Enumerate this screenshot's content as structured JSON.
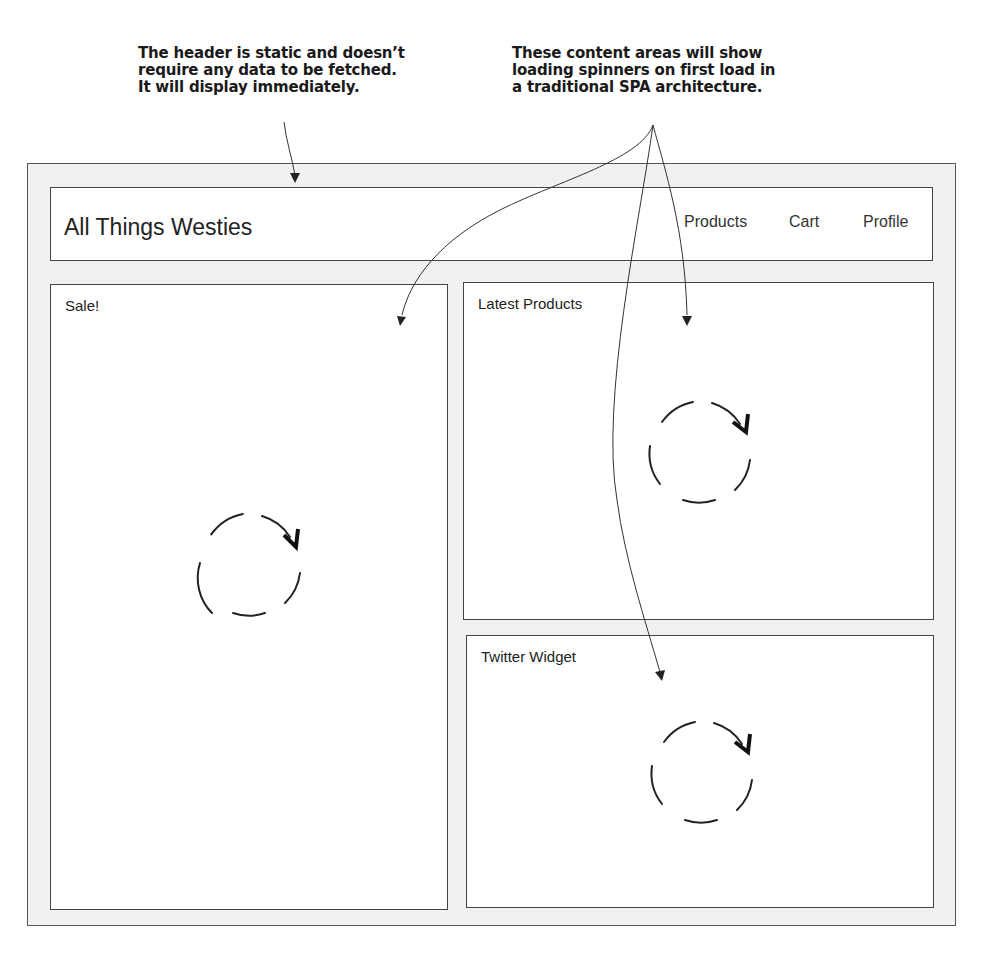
{
  "annotations": {
    "header_note": {
      "lines": [
        "The header is static and doesn’t",
        "require any data to be fetched.",
        "It will display immediately."
      ]
    },
    "content_note": {
      "lines": [
        "These content areas will show",
        "loading spinners on first load in",
        "a traditional SPA architecture."
      ]
    }
  },
  "header": {
    "title": "All Things Westies",
    "nav": [
      "Products",
      "Cart",
      "Profile"
    ]
  },
  "panels": {
    "sale": {
      "title": "Sale!",
      "state": "loading-spinner"
    },
    "latest_products": {
      "title": "Latest Products",
      "state": "loading-spinner"
    },
    "twitter_widget": {
      "title": "Twitter Widget",
      "state": "loading-spinner"
    }
  },
  "colors": {
    "frame_bg": "#f1f1f1",
    "border": "#444444",
    "text": "#222222"
  }
}
